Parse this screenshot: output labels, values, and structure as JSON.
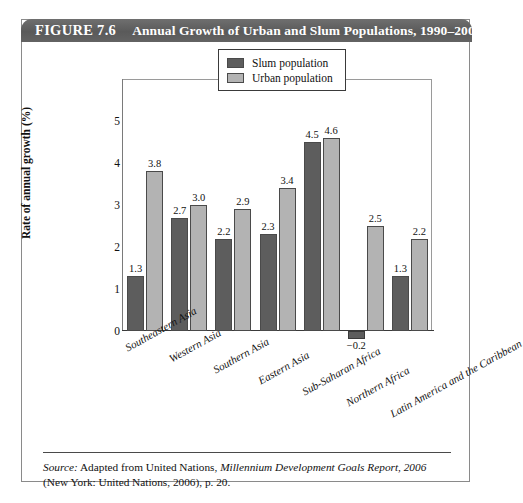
{
  "figure": {
    "number": "FIGURE 7.6",
    "title": "Annual Growth of Urban and Slum Populations, 1990–2001"
  },
  "source": {
    "label": "Source:",
    "text_before": " Adapted from United Nations, ",
    "italic_title": "Millennium Development Goals Report, 2006",
    "text_after": " (New York: United Nations, 2006), p. 20."
  },
  "chart_data": {
    "type": "bar",
    "title": "Annual Growth of Urban and Slum Populations, 1990–2001",
    "xlabel": "",
    "ylabel": "Rate of annual growth (%)",
    "ylim": [
      -0.5,
      6.0
    ],
    "yticks": [
      "0",
      "1",
      "2",
      "3",
      "4",
      "5"
    ],
    "grid": false,
    "legend_position": "top-right-inside",
    "categories": [
      "Southeastern Asia",
      "Western Asia",
      "Southern Asia",
      "Eastern Asia",
      "Sub-Saharan Africa",
      "Northern Africa",
      "Latin America and the Caribbean"
    ],
    "series": [
      {
        "name": "Slum population",
        "color": "#5d5d5d",
        "values": [
          1.3,
          2.7,
          2.2,
          2.3,
          4.5,
          -0.2,
          1.3
        ],
        "labels": [
          "1.3",
          "2.7",
          "2.2",
          "2.3",
          "4.5",
          "−0.2",
          "1.3"
        ]
      },
      {
        "name": "Urban population",
        "color": "#b3b3b3",
        "values": [
          3.8,
          3.0,
          2.9,
          3.4,
          4.6,
          2.5,
          2.2
        ],
        "labels": [
          "3.8",
          "3.0",
          "2.9",
          "3.4",
          "4.6",
          "2.5",
          "2.2"
        ]
      }
    ]
  }
}
